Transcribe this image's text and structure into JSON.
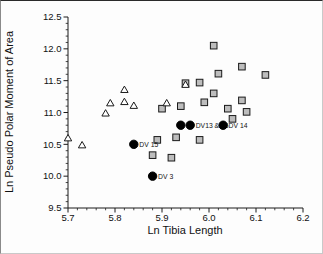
{
  "figure": {
    "kind": "scatter-plot"
  },
  "chart_data": {
    "type": "scatter",
    "title": "",
    "xlabel": "Ln Tibia Length",
    "ylabel": "Ln Pseudo Polar Moment of Area",
    "xlim": [
      5.7,
      6.2
    ],
    "ylim": [
      9.5,
      12.5
    ],
    "x_ticks": [
      5.7,
      5.8,
      5.9,
      6.0,
      6.1,
      6.2
    ],
    "y_ticks": [
      9.5,
      10.0,
      10.5,
      11.0,
      11.5,
      12.0,
      12.5
    ],
    "x_minor_step": 0.02,
    "y_minor_step": 0.1,
    "grid": false,
    "legend": false,
    "axis_color": "#1a1a1a",
    "series": [
      {
        "name": "comparative-sample-squares",
        "marker": "square",
        "fill": "#bdbdbd",
        "stroke": "#1a1a1a",
        "points": [
          [
            6.01,
            12.05
          ],
          [
            6.07,
            11.72
          ],
          [
            6.12,
            11.59
          ],
          [
            6.02,
            11.61
          ],
          [
            5.95,
            11.46
          ],
          [
            5.98,
            11.47
          ],
          [
            6.01,
            11.3
          ],
          [
            5.99,
            11.16
          ],
          [
            6.07,
            11.19
          ],
          [
            6.04,
            11.06
          ],
          [
            6.08,
            11.01
          ],
          [
            5.9,
            11.06
          ],
          [
            5.94,
            11.1
          ],
          [
            6.05,
            10.9
          ],
          [
            5.89,
            10.57
          ],
          [
            5.93,
            10.61
          ],
          [
            5.98,
            10.57
          ],
          [
            5.88,
            10.33
          ],
          [
            5.92,
            10.29
          ]
        ]
      },
      {
        "name": "comparative-sample-triangles",
        "marker": "triangle",
        "fill": "#ffffff",
        "stroke": "#1a1a1a",
        "points": [
          [
            5.82,
            11.36
          ],
          [
            5.79,
            11.15
          ],
          [
            5.82,
            11.17
          ],
          [
            5.84,
            11.11
          ],
          [
            5.78,
            10.99
          ],
          [
            5.91,
            11.15
          ],
          [
            5.95,
            11.44
          ],
          [
            5.7,
            10.6
          ],
          [
            5.73,
            10.49
          ]
        ]
      },
      {
        "name": "labeled-specimen-circles",
        "marker": "circle",
        "fill": "#000000",
        "stroke": "#000000",
        "points": [
          [
            5.84,
            10.5
          ],
          [
            5.88,
            10.0
          ],
          [
            5.94,
            10.8
          ],
          [
            5.96,
            10.8
          ],
          [
            6.03,
            10.8
          ]
        ],
        "labels": [
          "DV 15",
          "DV 3",
          "",
          "DV13 & 16",
          "DV 14"
        ]
      }
    ]
  }
}
